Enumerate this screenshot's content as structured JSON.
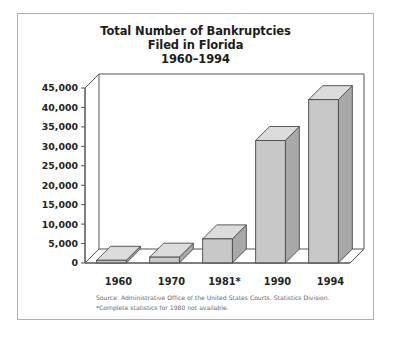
{
  "figure": {
    "title_lines": [
      "Total Number of Bankruptcies",
      "Filed in Florida",
      "1960–1994"
    ],
    "source_note": "Source: Administrative Office of the United States Courts, Statistics Division.",
    "footnote": "*Complete statistics for 1980 not available.",
    "colors": {
      "frame": "#b0b0b0",
      "axis": "#555555",
      "bar_front": "#c8c8c8",
      "bar_top": "#dcdcdc",
      "bar_side": "#a8a8a8",
      "bar_outline": "#4a4a4a",
      "title_text": "#1d1d1d",
      "tick_text": "#242424",
      "note_text": "#6a6a6a",
      "background": "#ffffff"
    }
  },
  "chart_data": {
    "type": "bar",
    "title": "Total Number of Bankruptcies Filed in Florida 1960–1994",
    "xlabel": "",
    "ylabel": "",
    "categories": [
      "1960",
      "1970",
      "1981*",
      "1990",
      "1994"
    ],
    "values": [
      700,
      1500,
      6200,
      31500,
      42000
    ],
    "ylim": [
      0,
      45000
    ],
    "yticks": [
      0,
      5000,
      10000,
      15000,
      20000,
      25000,
      30000,
      35000,
      40000,
      45000
    ],
    "ytick_labels": [
      "0",
      "5,000",
      "10,000",
      "15,000",
      "20,000",
      "25,000",
      "30,000",
      "35,000",
      "40,000",
      "45,000"
    ],
    "grid": false,
    "legend": false,
    "style": "3d-isometric-bars"
  }
}
